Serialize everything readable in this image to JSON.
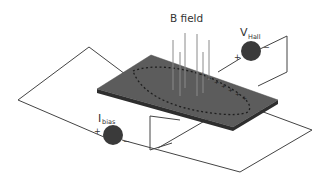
{
  "diagram": {
    "title_label": "B field",
    "hall_voltage": {
      "main": "V",
      "sub": "Hall",
      "plus": "+",
      "minus": "−"
    },
    "bias_current": {
      "main": "I",
      "sub": "bias",
      "plus": "+",
      "minus": "−"
    },
    "colors": {
      "plate_top": "#5a5a5a",
      "plate_edge": "#333333",
      "source_fill": "#3a3a3a",
      "wire": "#444444",
      "field_line": "#8a8a8a",
      "charge_marks": "#1e1e1e"
    },
    "elements": [
      "semiconductor-plate",
      "magnetic-field-lines",
      "hall-voltmeter",
      "bias-current-source",
      "bias-circuit-wire",
      "hall-circuit-wire",
      "charge-carrier-path"
    ]
  }
}
